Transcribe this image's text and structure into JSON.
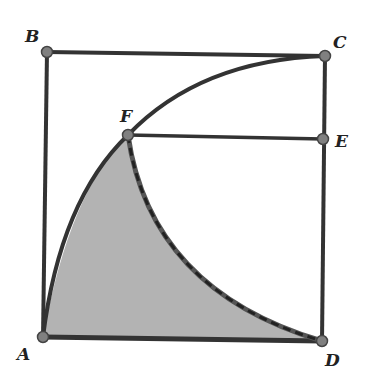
{
  "figure": {
    "colors": {
      "line": "#333333",
      "fill": "#b3b3b3",
      "point": "#808080"
    },
    "points": {
      "A": {
        "label": "A",
        "x": 43,
        "y": 337
      },
      "B": {
        "label": "B",
        "x": 47,
        "y": 52
      },
      "C": {
        "label": "C",
        "x": 325,
        "y": 56
      },
      "D": {
        "label": "D",
        "x": 322,
        "y": 341
      },
      "E": {
        "label": "E",
        "x": 323,
        "y": 139
      },
      "F": {
        "label": "F",
        "x": 128,
        "y": 135
      }
    },
    "segments": [
      "AB",
      "BC",
      "CD",
      "DA",
      "FE"
    ],
    "arcs": [
      "arc A-F-C centered at D",
      "arc F-D centered at E (dashed)"
    ],
    "shaded_region": "AFD"
  }
}
